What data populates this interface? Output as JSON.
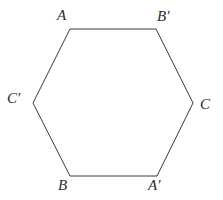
{
  "figure": {
    "type": "hexagon-diagram",
    "canvas": {
      "width": 223,
      "height": 200,
      "background": "#ffffff"
    },
    "shape": {
      "name": "hexagon",
      "sides": 6,
      "stroke_color": "#3a3a3a",
      "stroke_width": 1,
      "fill": "none",
      "points": "70,29 156,29 193,103 157,176 70,176 33,103"
    },
    "labels": [
      {
        "id": "A",
        "text": "A",
        "vertex_x": 70,
        "vertex_y": 29,
        "position": "top-left"
      },
      {
        "id": "Bp",
        "text": "B′",
        "vertex_x": 156,
        "vertex_y": 29,
        "position": "top-right"
      },
      {
        "id": "C",
        "text": "C",
        "vertex_x": 193,
        "vertex_y": 103,
        "position": "right"
      },
      {
        "id": "Ap",
        "text": "A′",
        "vertex_x": 157,
        "vertex_y": 176,
        "position": "bottom-right"
      },
      {
        "id": "B",
        "text": "B",
        "vertex_x": 70,
        "vertex_y": 176,
        "position": "bottom-left"
      },
      {
        "id": "Cp",
        "text": "C′",
        "vertex_x": 33,
        "vertex_y": 103,
        "position": "left"
      }
    ]
  }
}
